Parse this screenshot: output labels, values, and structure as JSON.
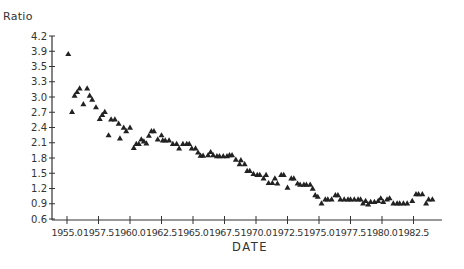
{
  "chart_data": {
    "type": "scatter",
    "title": "",
    "xlabel": "DATE",
    "ylabel": "Ratio",
    "marker": "triangle",
    "marker_color": "#222222",
    "grid": false,
    "legend": null,
    "xlim": [
      1954.0,
      1984.8
    ],
    "ylim": [
      0.6,
      4.2
    ],
    "x_ticks": [
      "1955.0",
      "1957.5",
      "1960.0",
      "1962.5",
      "1965.0",
      "1967.5",
      "1970.0",
      "1972.5",
      "1975.0",
      "1977.5",
      "1980.0",
      "1982.5"
    ],
    "y_ticks": [
      "4.2",
      "3.9",
      "3.5",
      "3.3",
      "3.0",
      "2.7",
      "2.4",
      "2.1",
      "1.8",
      "1.5",
      "1.2",
      "0.9",
      "0.6"
    ],
    "series": [
      {
        "name": "Ratio",
        "x": [
          1955.1,
          1955.4,
          1955.6,
          1955.8,
          1956.0,
          1956.3,
          1956.6,
          1956.8,
          1957.0,
          1957.3,
          1957.6,
          1957.8,
          1958.0,
          1958.3,
          1958.5,
          1958.8,
          1959.1,
          1959.2,
          1959.5,
          1959.7,
          1960.0,
          1960.3,
          1960.5,
          1960.7,
          1960.9,
          1961.1,
          1961.3,
          1961.5,
          1961.7,
          1961.9,
          1962.2,
          1962.5,
          1962.6,
          1962.8,
          1963.1,
          1963.4,
          1963.7,
          1963.9,
          1964.2,
          1964.5,
          1964.7,
          1964.9,
          1965.2,
          1965.4,
          1965.6,
          1965.8,
          1966.2,
          1966.4,
          1966.6,
          1966.9,
          1967.1,
          1967.4,
          1967.7,
          1967.9,
          1968.1,
          1968.4,
          1968.7,
          1968.8,
          1969.1,
          1969.3,
          1969.5,
          1969.8,
          1970.1,
          1970.3,
          1970.6,
          1970.8,
          1971.0,
          1971.3,
          1971.5,
          1971.7,
          1972.0,
          1972.2,
          1972.5,
          1972.8,
          1973.0,
          1973.3,
          1973.5,
          1973.8,
          1974.0,
          1974.3,
          1974.5,
          1974.7,
          1974.9,
          1975.2,
          1975.5,
          1975.7,
          1976.0,
          1976.3,
          1976.5,
          1976.7,
          1977.0,
          1977.3,
          1977.5,
          1977.8,
          1978.1,
          1978.3,
          1978.5,
          1978.7,
          1978.9,
          1979.1,
          1979.4,
          1979.7,
          1979.9,
          1980.1,
          1980.4,
          1980.6,
          1980.9,
          1981.2,
          1981.4,
          1981.7,
          1982.0,
          1982.4,
          1982.7,
          1982.9,
          1983.2,
          1983.5,
          1983.7,
          1984.0
        ],
        "y": [
          3.83,
          2.71,
          3.03,
          3.1,
          3.17,
          2.86,
          3.17,
          3.03,
          2.95,
          2.8,
          2.57,
          2.65,
          2.71,
          2.25,
          2.56,
          2.56,
          2.48,
          2.19,
          2.4,
          2.33,
          2.4,
          2.0,
          2.08,
          2.08,
          2.17,
          2.13,
          2.09,
          2.24,
          2.33,
          2.33,
          2.17,
          2.25,
          2.15,
          2.15,
          2.15,
          2.08,
          2.08,
          1.99,
          2.08,
          2.08,
          2.08,
          1.99,
          1.99,
          1.91,
          1.85,
          1.85,
          1.86,
          1.92,
          1.86,
          1.84,
          1.84,
          1.84,
          1.84,
          1.86,
          1.86,
          1.77,
          1.68,
          1.76,
          1.68,
          1.55,
          1.55,
          1.49,
          1.47,
          1.47,
          1.4,
          1.47,
          1.31,
          1.31,
          1.4,
          1.3,
          1.47,
          1.47,
          1.22,
          1.4,
          1.4,
          1.3,
          1.28,
          1.28,
          1.28,
          1.28,
          1.2,
          1.07,
          1.04,
          0.91,
          0.99,
          0.99,
          0.99,
          1.07,
          1.07,
          0.99,
          0.99,
          0.99,
          0.99,
          0.99,
          0.99,
          0.99,
          0.91,
          0.96,
          0.89,
          0.94,
          0.94,
          0.96,
          1.01,
          0.94,
          0.99,
          1.01,
          0.91,
          0.91,
          0.91,
          0.91,
          0.91,
          0.96,
          1.09,
          1.09,
          1.09,
          0.91,
          0.99,
          0.99
        ]
      }
    ]
  }
}
